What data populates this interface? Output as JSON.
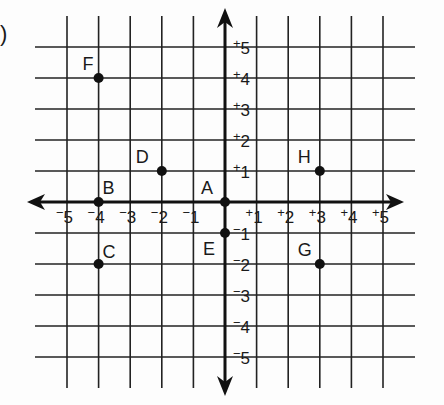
{
  "question_marker": ")",
  "chart_data": {
    "type": "scatter",
    "title": "",
    "xlabel": "",
    "ylabel": "",
    "xlim": [
      -5,
      5
    ],
    "ylim": [
      -5,
      5
    ],
    "grid": true,
    "x_tick_labels": [
      "-5",
      "-4",
      "-3",
      "-2",
      "-1",
      "+1",
      "+2",
      "+3",
      "+4",
      "+5"
    ],
    "y_tick_labels": [
      "+5",
      "+4",
      "+3",
      "+2",
      "+1",
      "-1",
      "-2",
      "-3",
      "-4",
      "-5"
    ],
    "points": [
      {
        "label": "A",
        "x": 0,
        "y": 0
      },
      {
        "label": "B",
        "x": -4,
        "y": 0
      },
      {
        "label": "C",
        "x": -4,
        "y": -2
      },
      {
        "label": "D",
        "x": -2,
        "y": 1
      },
      {
        "label": "E",
        "x": 0,
        "y": -1
      },
      {
        "label": "F",
        "x": -4,
        "y": 4
      },
      {
        "label": "G",
        "x": 3,
        "y": -2
      },
      {
        "label": "H",
        "x": 3,
        "y": 1
      }
    ]
  },
  "layout": {
    "origin_x": 225,
    "origin_y": 202,
    "unit_x": 31.6,
    "unit_y": 31,
    "grid_left": 35,
    "grid_right": 415,
    "grid_top": 16,
    "grid_bottom": 388,
    "axis_x_left": 27,
    "axis_x_right": 404,
    "axis_y_top": 8,
    "axis_y_bottom": 396,
    "line_color": "#222222",
    "point_color": "#111111"
  }
}
